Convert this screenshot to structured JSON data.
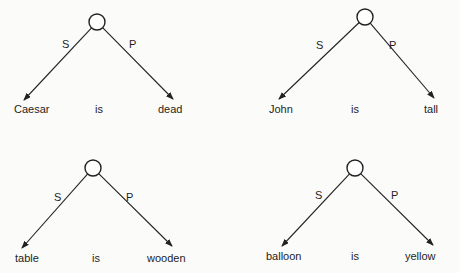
{
  "diagrams": [
    {
      "id": "caesar",
      "node": {
        "cx": 97,
        "cy": 22,
        "r": 8
      },
      "subject_edge": {
        "label": "S",
        "x2": 24,
        "y2": 100,
        "lx": 62,
        "ly": 48
      },
      "predicate_edge": {
        "label": "P",
        "x2": 173,
        "y2": 99,
        "lx": 129,
        "ly": 48
      },
      "words": {
        "subject": "Caesar",
        "copula": "is",
        "predicate": "dead"
      },
      "word_pos": {
        "subject_x": 14,
        "copula_x": 95,
        "predicate_x": 158,
        "y": 113
      }
    },
    {
      "id": "john",
      "node": {
        "cx": 365,
        "cy": 17,
        "r": 8
      },
      "subject_edge": {
        "label": "S",
        "x2": 279,
        "y2": 99,
        "lx": 316,
        "ly": 49
      },
      "predicate_edge": {
        "label": "P",
        "x2": 434,
        "y2": 98,
        "lx": 389,
        "ly": 49
      },
      "words": {
        "subject": "John",
        "copula": "is",
        "predicate": "tall"
      },
      "word_pos": {
        "subject_x": 269,
        "copula_x": 351,
        "predicate_x": 424,
        "y": 113
      }
    },
    {
      "id": "table",
      "node": {
        "cx": 93,
        "cy": 168,
        "r": 8
      },
      "subject_edge": {
        "label": "S",
        "x2": 22,
        "y2": 248,
        "lx": 54,
        "ly": 201
      },
      "predicate_edge": {
        "label": "P",
        "x2": 172,
        "y2": 246,
        "lx": 126,
        "ly": 201
      },
      "words": {
        "subject": "table",
        "copula": "is",
        "predicate": "wooden"
      },
      "word_pos": {
        "subject_x": 15,
        "copula_x": 92,
        "predicate_x": 147,
        "y": 262
      }
    },
    {
      "id": "balloon",
      "node": {
        "cx": 355,
        "cy": 168,
        "r": 8
      },
      "subject_edge": {
        "label": "S",
        "x2": 282,
        "y2": 246,
        "lx": 315,
        "ly": 199
      },
      "predicate_edge": {
        "label": "P",
        "x2": 433,
        "y2": 245,
        "lx": 391,
        "ly": 199
      },
      "words": {
        "subject": "balloon",
        "copula": "is",
        "predicate": "yellow"
      },
      "word_pos": {
        "subject_x": 266,
        "copula_x": 351,
        "predicate_x": 405,
        "y": 260
      }
    }
  ],
  "colors": {
    "ink": "#222222",
    "background": "#fbfbf9"
  }
}
